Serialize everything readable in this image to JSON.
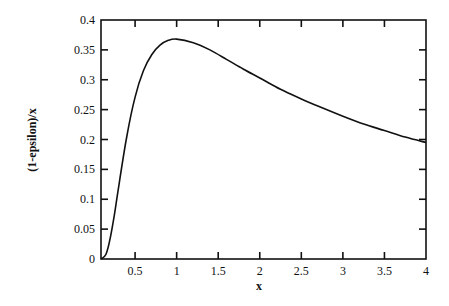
{
  "chart_data": {
    "type": "line",
    "title": "",
    "xlabel": "x",
    "ylabel": "(1-epsilon)/x",
    "xlim": [
      0.09,
      4
    ],
    "ylim": [
      0,
      0.4
    ],
    "grid": false,
    "legend": null,
    "x_ticks": [
      "0.5",
      "1",
      "1.5",
      "2",
      "2.5",
      "3",
      "3.5",
      "4"
    ],
    "y_ticks": [
      "0",
      "0.05",
      "0.1",
      "0.15",
      "0.2",
      "0.25",
      "0.3",
      "0.35",
      "0.4"
    ],
    "series": [
      {
        "name": "(1-epsilon)/x",
        "x": [
          0.09,
          0.15,
          0.2,
          0.25,
          0.3,
          0.4,
          0.5,
          0.6,
          0.7,
          0.8,
          0.9,
          1.0,
          1.2,
          1.4,
          1.6,
          1.8,
          2.0,
          2.25,
          2.5,
          2.75,
          3.0,
          3.25,
          3.5,
          3.75,
          4.0
        ],
        "values": [
          0.0,
          0.008,
          0.034,
          0.073,
          0.119,
          0.205,
          0.271,
          0.315,
          0.342,
          0.358,
          0.366,
          0.368,
          0.362,
          0.35,
          0.334,
          0.318,
          0.303,
          0.284,
          0.268,
          0.253,
          0.239,
          0.226,
          0.215,
          0.204,
          0.195
        ]
      }
    ]
  },
  "labels": {
    "xlabel": "x",
    "ylabel": "(1-epsilon)/x"
  }
}
